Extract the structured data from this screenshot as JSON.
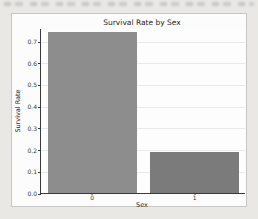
{
  "page": {
    "background_color": "#e9e8e4",
    "card_background": "#fcfcfc",
    "card_border_color": "#c6c6c6"
  },
  "chart_data": {
    "type": "bar",
    "title": "Survival Rate by Sex",
    "xlabel": "Sex",
    "ylabel": "Survival Rate",
    "categories": [
      "0",
      "1"
    ],
    "values": [
      0.74,
      0.19
    ],
    "bar_colors": [
      "#8d8d8d",
      "#7b7b7b"
    ],
    "ytick_labels": [
      "0.0",
      "0.1",
      "0.2",
      "0.3",
      "0.4",
      "0.5",
      "0.6",
      "0.7"
    ],
    "yticks": [
      0.0,
      0.1,
      0.2,
      0.3,
      0.4,
      0.5,
      0.6,
      0.7
    ],
    "ylim": [
      0,
      0.76
    ],
    "grid": true,
    "gridline_color": "#e9e9e9",
    "spine_color": "#3a3a3a",
    "legend": "none",
    "bar_width_fraction": 0.865
  }
}
